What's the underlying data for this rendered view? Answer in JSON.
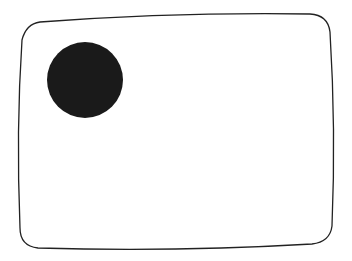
{
  "diagram": {
    "frame": {
      "shape": "rounded-rectangle (slightly bulging, CRT-style)",
      "stroke_color": "#222222",
      "fill_color": "#ffffff"
    },
    "circle": {
      "fill_color": "#1a1a1a",
      "cx": 85,
      "cy": 80,
      "r": 38
    }
  }
}
